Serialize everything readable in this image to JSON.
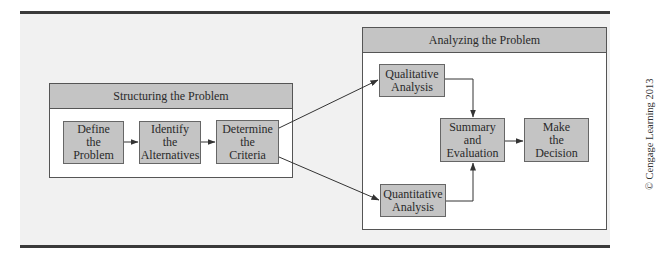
{
  "diagram": {
    "structuring_group": {
      "title": "Structuring the Problem",
      "nodes": [
        {
          "id": "define",
          "lines": [
            "Define",
            "the",
            "Problem"
          ]
        },
        {
          "id": "identify",
          "lines": [
            "Identify",
            "the",
            "Alternatives"
          ]
        },
        {
          "id": "determine",
          "lines": [
            "Determine",
            "the",
            "Criteria"
          ]
        }
      ]
    },
    "analyzing_group": {
      "title": "Analyzing the Problem",
      "nodes": [
        {
          "id": "qualitative",
          "lines": [
            "Qualitative",
            "Analysis"
          ]
        },
        {
          "id": "quantitative",
          "lines": [
            "Quantitative",
            "Analysis"
          ]
        },
        {
          "id": "summary",
          "lines": [
            "Summary",
            "and",
            "Evaluation"
          ]
        },
        {
          "id": "decision",
          "lines": [
            "Make",
            "the",
            "Decision"
          ]
        }
      ]
    },
    "edges": [
      {
        "from": "define",
        "to": "identify"
      },
      {
        "from": "identify",
        "to": "determine"
      },
      {
        "from": "determine",
        "to": "qualitative"
      },
      {
        "from": "determine",
        "to": "quantitative"
      },
      {
        "from": "qualitative",
        "to": "summary"
      },
      {
        "from": "quantitative",
        "to": "summary"
      },
      {
        "from": "summary",
        "to": "decision"
      }
    ],
    "credit": "© Cengage Learning 2013"
  },
  "colors": {
    "box_fill": "#c4c4c4",
    "panel_bg": "#f1f1f1",
    "rule": "#3a3a3a"
  }
}
